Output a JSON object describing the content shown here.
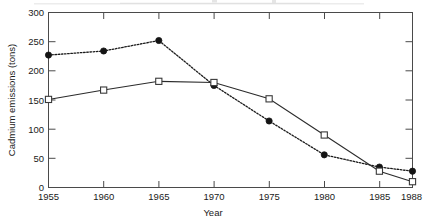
{
  "chart_data": {
    "type": "line",
    "title": "",
    "xlabel": "Year",
    "ylabel": "Cadmium emissions (tons)",
    "x": [
      1955,
      1960,
      1965,
      1970,
      1975,
      1980,
      1985,
      1988
    ],
    "xtick_labels": [
      "1955",
      "1960",
      "1965",
      "1970",
      "1975",
      "1980",
      "1985",
      "1988"
    ],
    "ytick_labels": [
      "0",
      "50",
      "100",
      "150",
      "200",
      "250",
      "300"
    ],
    "yticks": [
      0,
      50,
      100,
      150,
      200,
      250,
      300
    ],
    "xlim": [
      1955,
      1988
    ],
    "ylim": [
      0,
      300
    ],
    "grid": false,
    "legend": "none",
    "frame": "box-all-sides-inward-ticks",
    "series": [
      {
        "name": "dotted-filled-circle-series",
        "marker": "filled-circle",
        "line_style": "dotted",
        "color": "#141414",
        "values": [
          227,
          234,
          252,
          175,
          114,
          56,
          35,
          28
        ]
      },
      {
        "name": "solid-open-square-series",
        "marker": "open-square",
        "line_style": "solid",
        "color": "#2b2b2b",
        "values": [
          151,
          167,
          182,
          180,
          152,
          90,
          28,
          10
        ]
      }
    ]
  },
  "axes": {
    "y_title": "Cadmium emissions (tons)",
    "x_title": "Year",
    "y_labels": [
      "300",
      "250",
      "200",
      "150",
      "100",
      "50",
      "0"
    ],
    "x_labels": [
      "1955",
      "1960",
      "1965",
      "1970",
      "1975",
      "1980",
      "1985",
      "1988"
    ]
  }
}
